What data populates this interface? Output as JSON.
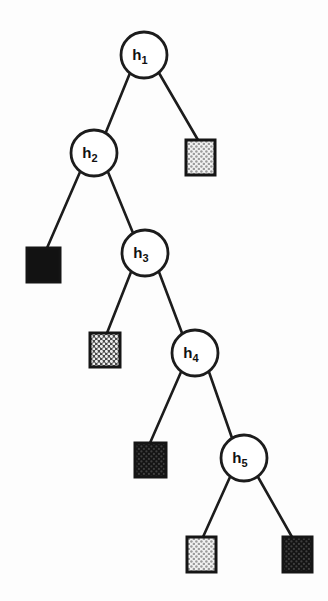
{
  "diagram": {
    "background_color": "#fdfdfd",
    "stroke_color": "#1c1c1c",
    "width": 328,
    "height": 601,
    "nodes": [
      {
        "id": "h1",
        "label": "h",
        "subscript": "1",
        "cx": 144,
        "cy": 55,
        "r": 23
      },
      {
        "id": "h2",
        "label": "h",
        "subscript": "2",
        "cx": 94,
        "cy": 153,
        "r": 23
      },
      {
        "id": "h3",
        "label": "h",
        "subscript": "3",
        "cx": 145,
        "cy": 253,
        "r": 23
      },
      {
        "id": "h4",
        "label": "h",
        "subscript": "4",
        "cx": 195,
        "cy": 353,
        "r": 23
      },
      {
        "id": "h5",
        "label": "h",
        "subscript": "5",
        "cx": 244,
        "cy": 458,
        "r": 23
      }
    ],
    "leaves": [
      {
        "id": "leaf-1",
        "parent": "h1",
        "side": "right",
        "x": 186,
        "y": 140,
        "w": 29,
        "h": 35,
        "pattern": "light-checker",
        "fill_color": "#e7e7e7"
      },
      {
        "id": "leaf-2",
        "parent": "h2",
        "side": "left",
        "x": 27,
        "y": 248,
        "w": 33,
        "h": 34,
        "pattern": "solid-black",
        "fill_color": "#121212"
      },
      {
        "id": "leaf-3",
        "parent": "h3",
        "side": "left",
        "x": 90,
        "y": 333,
        "w": 30,
        "h": 34,
        "pattern": "medium-checker",
        "fill_color": "#d2d2d2"
      },
      {
        "id": "leaf-4",
        "parent": "h4",
        "side": "left",
        "x": 135,
        "y": 443,
        "w": 31,
        "h": 34,
        "pattern": "dark-dotted",
        "fill_color": "#1d1d1d"
      },
      {
        "id": "leaf-5",
        "parent": "h5",
        "side": "left",
        "x": 187,
        "y": 537,
        "w": 29,
        "h": 35,
        "pattern": "light-checker",
        "fill_color": "#e7e7e7"
      },
      {
        "id": "leaf-6",
        "parent": "h5",
        "side": "right",
        "x": 283,
        "y": 537,
        "w": 29,
        "h": 35,
        "pattern": "dark-dotted",
        "fill_color": "#1d1d1d"
      }
    ],
    "edges": [
      {
        "id": "edge-h1-h2",
        "from": "h1",
        "to": "h2",
        "x1": 130,
        "y1": 73,
        "x2": 106,
        "y2": 132
      },
      {
        "id": "edge-h1-leaf1",
        "from": "h1",
        "to": "leaf-1",
        "x1": 159,
        "y1": 73,
        "x2": 198,
        "y2": 140
      },
      {
        "id": "edge-h2-leaf2",
        "from": "h2",
        "to": "leaf-2",
        "x1": 80,
        "y1": 172,
        "x2": 47,
        "y2": 248
      },
      {
        "id": "edge-h2-h3",
        "from": "h2",
        "to": "h3",
        "x1": 108,
        "y1": 172,
        "x2": 133,
        "y2": 233
      },
      {
        "id": "edge-h3-leaf3",
        "from": "h3",
        "to": "leaf-3",
        "x1": 131,
        "y1": 272,
        "x2": 107,
        "y2": 333
      },
      {
        "id": "edge-h3-h4",
        "from": "h3",
        "to": "h4",
        "x1": 159,
        "y1": 272,
        "x2": 182,
        "y2": 333
      },
      {
        "id": "edge-h4-leaf4",
        "from": "h4",
        "to": "leaf-4",
        "x1": 181,
        "y1": 372,
        "x2": 150,
        "y2": 443
      },
      {
        "id": "edge-h4-h5",
        "from": "h4",
        "to": "h5",
        "x1": 209,
        "y1": 372,
        "x2": 232,
        "y2": 438
      },
      {
        "id": "edge-h5-leaf5",
        "from": "h5",
        "to": "leaf-5",
        "x1": 230,
        "y1": 477,
        "x2": 203,
        "y2": 537
      },
      {
        "id": "edge-h5-leaf6",
        "from": "h5",
        "to": "leaf-6",
        "x1": 258,
        "y1": 477,
        "x2": 292,
        "y2": 537
      }
    ]
  }
}
